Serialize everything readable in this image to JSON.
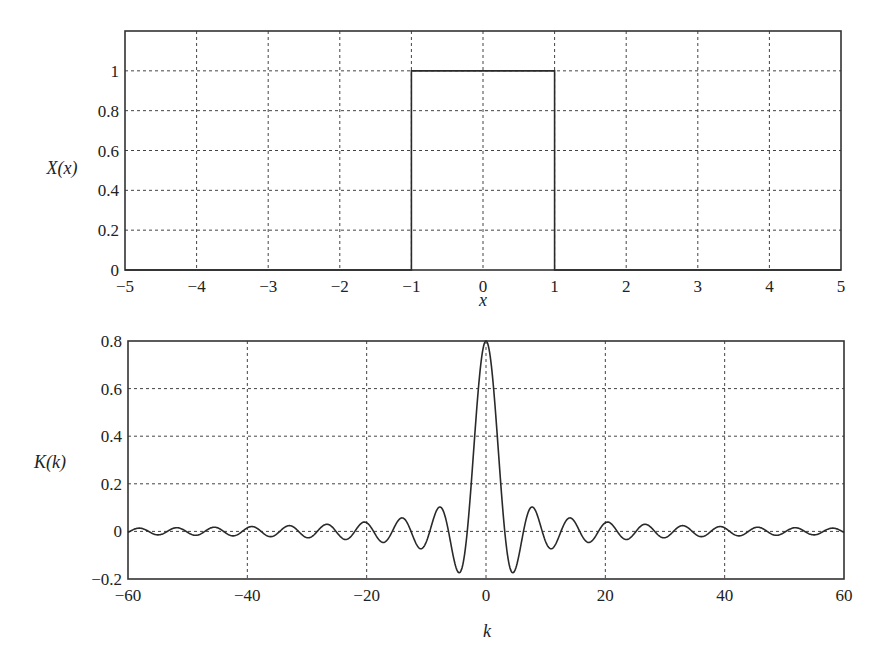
{
  "chart_data": [
    {
      "type": "line",
      "title": "",
      "xlabel": "x",
      "ylabel": "X(x)",
      "xlim": [
        -5,
        5
      ],
      "ylim": [
        0,
        1.2
      ],
      "grid": true,
      "xticks": [
        -5,
        -4,
        -3,
        -2,
        -1,
        0,
        1,
        2,
        3,
        4,
        5
      ],
      "xtick_labels": [
        "−5",
        "−4",
        "−3",
        "−2",
        "−1",
        "0",
        "1",
        "2",
        "3",
        "4",
        "5"
      ],
      "yticks": [
        0,
        0.2,
        0.4,
        0.6,
        0.8,
        1
      ],
      "ytick_labels": [
        "0",
        "0.2",
        "0.4",
        "0.6",
        "0.8",
        "1"
      ],
      "series": [
        {
          "name": "X(x)",
          "x": [
            -5,
            -1,
            -1,
            1,
            1,
            5
          ],
          "y": [
            0,
            0,
            1,
            1,
            0,
            0
          ]
        }
      ],
      "description": "Rectangular pulse of height 1 on -1 <= x <= 1"
    },
    {
      "type": "line",
      "title": "",
      "xlabel": "k",
      "ylabel": "K(k)",
      "xlim": [
        -60,
        60
      ],
      "ylim": [
        -0.2,
        0.8
      ],
      "grid": true,
      "xticks": [
        -60,
        -40,
        -20,
        0,
        20,
        40,
        60
      ],
      "xtick_labels": [
        "−60",
        "−40",
        "−20",
        "0",
        "20",
        "40",
        "60"
      ],
      "yticks": [
        -0.2,
        0,
        0.2,
        0.4,
        0.6,
        0.8
      ],
      "ytick_labels": [
        "−0.2",
        "0",
        "0.2",
        "0.4",
        "0.6",
        "0.8"
      ],
      "series": [
        {
          "name": "K(k)",
          "formula": "0.8*sin(k)/k",
          "x": [
            -60,
            -50,
            -40,
            -30,
            -20,
            -14.07,
            -10.9,
            -7.73,
            -4.49,
            -3.14,
            -2,
            -1,
            0,
            1,
            2,
            3.14,
            4.49,
            7.73,
            10.9,
            14.07,
            20,
            30,
            40,
            50,
            60
          ],
          "y": [
            0.004,
            0.004,
            0.015,
            0.026,
            0.037,
            0.057,
            -0.072,
            0.102,
            -0.174,
            0,
            0.364,
            0.673,
            0.8,
            0.673,
            0.364,
            0,
            -0.174,
            0.102,
            -0.072,
            0.057,
            0.037,
            0.026,
            0.015,
            0.004,
            0.004
          ]
        }
      ],
      "description": "Sinc-shaped transform: main lobe peak 0.8 at k=0, decaying oscillating side lobes"
    }
  ]
}
